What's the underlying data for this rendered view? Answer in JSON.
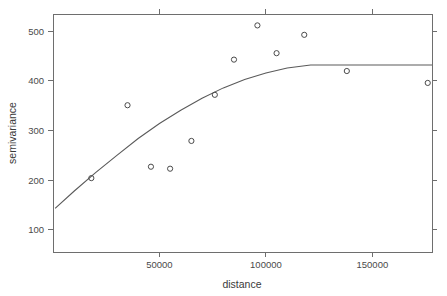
{
  "chart_data": {
    "type": "scatter",
    "title": "",
    "xlabel": "distance",
    "ylabel": "semivariance",
    "xlim": [
      0,
      178000
    ],
    "ylim": [
      55,
      535
    ],
    "grid": false,
    "legend": null,
    "x_ticks": [
      50000,
      100000,
      150000
    ],
    "x_tick_labels": [
      "50000",
      "100000",
      "150000"
    ],
    "y_ticks": [
      100,
      200,
      300,
      400,
      500
    ],
    "y_tick_labels": [
      "100",
      "200",
      "300",
      "400",
      "500"
    ],
    "series": [
      {
        "name": "empirical semivariance",
        "type": "scatter",
        "marker": "open-circle",
        "color": "#4a4a4a",
        "points": [
          {
            "x": 18000,
            "y": 204
          },
          {
            "x": 35000,
            "y": 351
          },
          {
            "x": 46000,
            "y": 227
          },
          {
            "x": 55000,
            "y": 223
          },
          {
            "x": 65000,
            "y": 279
          },
          {
            "x": 76000,
            "y": 372
          },
          {
            "x": 85000,
            "y": 443
          },
          {
            "x": 96000,
            "y": 512
          },
          {
            "x": 105000,
            "y": 456
          },
          {
            "x": 118000,
            "y": 493
          },
          {
            "x": 138000,
            "y": 420
          },
          {
            "x": 176000,
            "y": 396
          }
        ]
      },
      {
        "name": "fitted variogram model",
        "type": "line",
        "color": "#5a5a5a",
        "model": "spherical",
        "nugget": 135,
        "sill": 432,
        "range": 121000,
        "points": [
          {
            "x": 1000,
            "y": 143
          },
          {
            "x": 10000,
            "y": 178
          },
          {
            "x": 20000,
            "y": 215
          },
          {
            "x": 30000,
            "y": 250
          },
          {
            "x": 40000,
            "y": 284
          },
          {
            "x": 50000,
            "y": 314
          },
          {
            "x": 60000,
            "y": 341
          },
          {
            "x": 70000,
            "y": 365
          },
          {
            "x": 80000,
            "y": 386
          },
          {
            "x": 90000,
            "y": 403
          },
          {
            "x": 100000,
            "y": 416
          },
          {
            "x": 110000,
            "y": 426
          },
          {
            "x": 121000,
            "y": 432
          },
          {
            "x": 140000,
            "y": 432
          },
          {
            "x": 160000,
            "y": 432
          },
          {
            "x": 178000,
            "y": 432
          }
        ]
      }
    ]
  },
  "geometry": {
    "plot_left": 53,
    "plot_right": 432,
    "plot_top": 14,
    "plot_bottom": 252,
    "x_pixel_per_unit": 0.00204,
    "y_pixel_per_unit": 0.44
  }
}
